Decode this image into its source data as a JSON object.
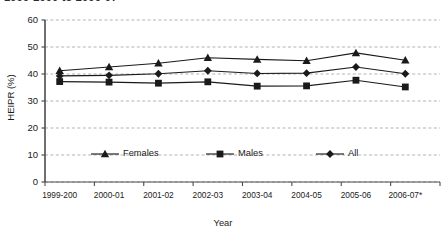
{
  "figure": {
    "cut_off_heading": "1999-2000 to 2006-07",
    "background_color": "#ffffff",
    "series_color": "#1a1a1a",
    "grid_color": "#b3b3b3",
    "axis_color": "#4d4d4d"
  },
  "chart_data": {
    "type": "line",
    "title": "",
    "xlabel": "Year",
    "ylabel": "HEIPR (%)",
    "ylim": [
      0,
      60
    ],
    "yticks": [
      0,
      10,
      20,
      30,
      40,
      50,
      60
    ],
    "ytick_labels": [
      "0",
      "10",
      "20",
      "30",
      "40",
      "50",
      "60"
    ],
    "grid": "horizontal-dashed",
    "legend_position": "inside-lower-center",
    "categories": [
      "1999-200",
      "2000-01",
      "2001-02",
      "2002-03",
      "2003-04",
      "2004-05",
      "2005-06",
      "2006-07*"
    ],
    "series": [
      {
        "name": "Females",
        "marker": "triangle",
        "values": [
          41.2,
          42.6,
          44.0,
          46.0,
          45.4,
          44.9,
          47.8,
          45.1
        ]
      },
      {
        "name": "Males",
        "marker": "square",
        "values": [
          37.2,
          37.0,
          36.6,
          37.1,
          35.5,
          35.6,
          37.7,
          35.2
        ]
      },
      {
        "name": "All",
        "marker": "diamond",
        "values": [
          39.3,
          39.5,
          40.1,
          41.2,
          40.2,
          40.3,
          42.6,
          40.1
        ]
      }
    ],
    "annotations": [
      "* indicates provisional data for 2006-07"
    ]
  }
}
